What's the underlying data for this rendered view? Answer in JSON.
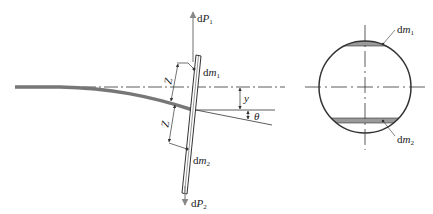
{
  "diagram": {
    "left_view": {
      "force_top": {
        "prefix": "d",
        "symbol": "P",
        "subscript": "1"
      },
      "force_bottom": {
        "prefix": "d",
        "symbol": "P",
        "subscript": "2"
      },
      "mass_top": {
        "prefix": "d",
        "symbol": "m",
        "subscript": "1"
      },
      "mass_bottom": {
        "prefix": "d",
        "symbol": "m",
        "subscript": "2"
      },
      "dim_upper": "Z",
      "dim_lower": "Z",
      "deflection": "y",
      "angle": "θ"
    },
    "right_view": {
      "mass_top": {
        "prefix": "d",
        "symbol": "m",
        "subscript": "1"
      },
      "mass_bottom": {
        "prefix": "d",
        "symbol": "m",
        "subscript": "2"
      }
    }
  },
  "colors": {
    "line": "#333333",
    "beam": "#777777",
    "strip_fill": "#9a9a9a",
    "arrow": "#888888"
  }
}
